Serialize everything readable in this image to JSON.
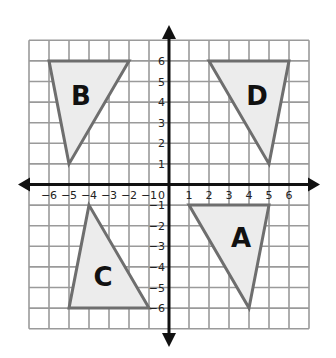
{
  "chart_data": {
    "type": "coordinate-grid",
    "xlim": [
      -7,
      7
    ],
    "ylim": [
      -7,
      7
    ],
    "grid": true,
    "x_ticks": [
      -6,
      -5,
      -4,
      -3,
      -2,
      -1,
      0,
      1,
      2,
      3,
      4,
      5,
      6
    ],
    "y_ticks": [
      6,
      5,
      4,
      3,
      2,
      1,
      -1,
      -2,
      -3,
      -4,
      -5,
      -6
    ],
    "x_tick_labels": [
      "-6",
      "-5",
      "-4",
      "-3",
      "-2",
      "-1",
      "0",
      "1",
      "2",
      "3",
      "4",
      "5",
      "6"
    ],
    "y_tick_labels": [
      "6",
      "5",
      "4",
      "3",
      "2",
      "1",
      "-1",
      "-2",
      "-3",
      "-4",
      "-5",
      "-6"
    ],
    "shapes": [
      {
        "label": "A",
        "vertices": [
          [
            1,
            -1
          ],
          [
            5,
            -1
          ],
          [
            4,
            -6
          ]
        ],
        "label_pos": [
          3.6,
          -2.6
        ]
      },
      {
        "label": "B",
        "vertices": [
          [
            -6,
            6
          ],
          [
            -2,
            6
          ],
          [
            -5,
            1
          ]
        ],
        "label_pos": [
          -4.4,
          4.3
        ]
      },
      {
        "label": "C",
        "vertices": [
          [
            -4,
            -1
          ],
          [
            -5,
            -6
          ],
          [
            -1,
            -6
          ]
        ],
        "label_pos": [
          -3.3,
          -4.5
        ]
      },
      {
        "label": "D",
        "vertices": [
          [
            2,
            6
          ],
          [
            6,
            6
          ],
          [
            5,
            1
          ]
        ],
        "label_pos": [
          4.4,
          4.3
        ]
      }
    ],
    "colors": {
      "grid": "#9a9a9a",
      "axis": "#111111",
      "shape_fill": "#ececec",
      "shape_stroke": "#6e6e6e",
      "label": "#111111"
    }
  }
}
